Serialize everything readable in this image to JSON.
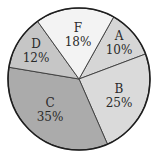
{
  "chart_data": {
    "type": "pie",
    "title": "",
    "categories": [
      "A",
      "B",
      "C",
      "D",
      "F"
    ],
    "values": [
      10,
      25,
      35,
      12,
      18
    ],
    "labels": [
      "10%",
      "25%",
      "35%",
      "12%",
      "18%"
    ],
    "unit": "%",
    "legend": "none (labels inside slices)",
    "slices": [
      {
        "name": "A",
        "value": 10,
        "label": "10%",
        "color": "#d6d6d6",
        "start": -60.8,
        "end": -20.6,
        "lx": 119,
        "ly": 40
      },
      {
        "name": "B",
        "value": 25,
        "label": "25%",
        "color": "#dadada",
        "start": -20.6,
        "end": 66.4,
        "lx": 119,
        "ly": 93
      },
      {
        "name": "C",
        "value": 35,
        "label": "35%",
        "color": "#ababab",
        "start": 66.4,
        "end": 189.5,
        "lx": 50,
        "ly": 107
      },
      {
        "name": "D",
        "value": 12,
        "label": "12%",
        "color": "#c6c6c6",
        "start": 189.5,
        "end": 234.3,
        "lx": 36,
        "ly": 48
      },
      {
        "name": "F",
        "value": 18,
        "label": "18%",
        "color": "#f3f3f3",
        "start": 234.3,
        "end": 299.2,
        "lx": 78,
        "ly": 32
      }
    ],
    "center": [
      79,
      79
    ],
    "radius": 71
  }
}
